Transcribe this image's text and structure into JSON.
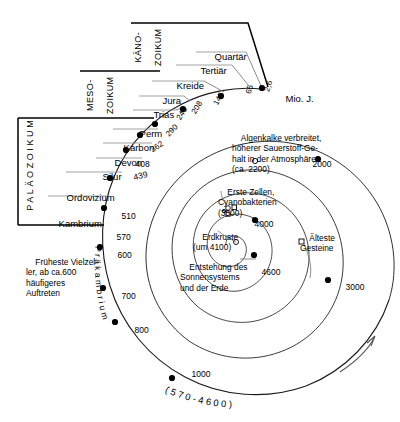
{
  "diagram": {
    "unit_label": "Mio. J.",
    "precambrian_curved_label": "P r ä k a m b r i u m",
    "precambrian_range_label": "( 5 7 0 - 4 6 0 0 )",
    "direction_arrow": "time-direction-arrow"
  },
  "eras": [
    {
      "id": "kaenozoikum",
      "line1": "KÄNO-",
      "line2": "ZOIKUM"
    },
    {
      "id": "mesozoikum",
      "line1": "MESO-",
      "line2": "ZOIKUM"
    },
    {
      "id": "palaeozoikum",
      "line1": "PALÄOZOIKUM",
      "line2": ""
    }
  ],
  "periods": [
    {
      "name": "Quartär",
      "boundary": "2,6"
    },
    {
      "name": "Tertiär",
      "boundary": "65"
    },
    {
      "name": "Kreide",
      "boundary": "145"
    },
    {
      "name": "Jura",
      "boundary": "208"
    },
    {
      "name": "Trias",
      "boundary": "245"
    },
    {
      "name": "Perm",
      "boundary": "290"
    },
    {
      "name": "Karbon",
      "boundary": "362"
    },
    {
      "name": "Devon",
      "boundary": "408"
    },
    {
      "name": "Silur",
      "boundary": "439"
    },
    {
      "name": "Ordovizium",
      "boundary": "510"
    },
    {
      "name": "Kambrium",
      "boundary": "570"
    }
  ],
  "spiral_markers": [
    {
      "value": "2,6"
    },
    {
      "value": "65"
    },
    {
      "value": "145"
    },
    {
      "value": "208"
    },
    {
      "value": "245"
    },
    {
      "value": "290"
    },
    {
      "value": "362"
    },
    {
      "value": "408"
    },
    {
      "value": "439"
    },
    {
      "value": "510"
    },
    {
      "value": "570"
    },
    {
      "value": "600"
    },
    {
      "value": "700"
    },
    {
      "value": "800"
    },
    {
      "value": "1000"
    },
    {
      "value": "2000"
    },
    {
      "value": "3000"
    },
    {
      "value": "4000"
    },
    {
      "value": "4600"
    }
  ],
  "annotations": {
    "multicellular": "Früheste Vielzel-\nler, ab ca.600\nhäufigeres\nAuftreten",
    "algae_oxygen": "Algenkalke verbreitet,\nhöherer Sauerstoff-Ge-\nhalt in der Atmosphäre\n(ca. 2200)",
    "first_cells": "Erste Zellen,\nCyanobakterien\n(3500)",
    "crust": "Erdkruste\n(um 4100)",
    "oldest_rocks": "Älteste\nGesteine",
    "solar_system": "Entstehung des\nSonnensystems\nund der Erde"
  },
  "colors": {
    "ink": "#000000",
    "spiral": "#1a1a1a",
    "background": "#ffffff"
  }
}
